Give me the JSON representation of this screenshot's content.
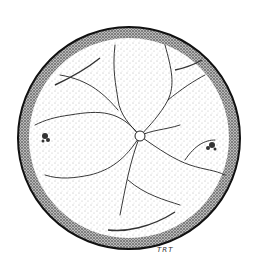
{
  "illustration": {
    "subject": "Stippled ink drawing of an ocular fundus (retina) with branching blood vessels radiating from the optic disc",
    "signature": "TRT",
    "colors": {
      "ink": "#1a1a1a",
      "paper": "#ffffff",
      "stipple": "#555555"
    }
  }
}
